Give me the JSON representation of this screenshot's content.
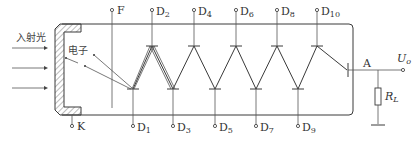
{
  "diagram": {
    "incident_light_label": "入射光",
    "electron_label": "电子",
    "cathode_label": "K",
    "focus_electrode_label": "F",
    "anode_label": "A",
    "output_label": {
      "main": "U",
      "sub": "o"
    },
    "load_resistor_label": {
      "main": "R",
      "sub": "L"
    },
    "top_dynodes": [
      {
        "main": "D",
        "sub": "2"
      },
      {
        "main": "D",
        "sub": "4"
      },
      {
        "main": "D",
        "sub": "6"
      },
      {
        "main": "D",
        "sub": "8"
      },
      {
        "main": "D",
        "sub": "10"
      }
    ],
    "bottom_dynodes": [
      {
        "main": "D",
        "sub": "1"
      },
      {
        "main": "D",
        "sub": "3"
      },
      {
        "main": "D",
        "sub": "5"
      },
      {
        "main": "D",
        "sub": "7"
      },
      {
        "main": "D",
        "sub": "9"
      }
    ],
    "colors": {
      "line": "#3a3a3a",
      "text": "#333333",
      "background": "#ffffff"
    }
  }
}
